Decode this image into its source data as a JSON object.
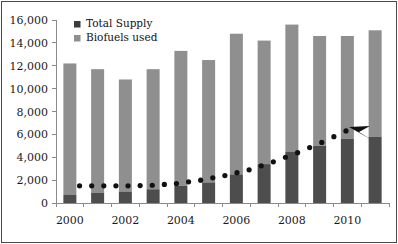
{
  "chart_data": {
    "type": "bar",
    "title": "",
    "subtitle": "",
    "xlabel": "",
    "ylabel": "",
    "stacked": true,
    "grid": false,
    "legend_position": "top-left",
    "ylim": [
      0,
      16000
    ],
    "ytick_labels": [
      "16,000",
      "14,000",
      "12,000",
      "10,000",
      "8,000",
      "6,000",
      "4,000",
      "2,000",
      "0"
    ],
    "ytick_values": [
      16000,
      14000,
      12000,
      10000,
      8000,
      6000,
      4000,
      2000,
      0
    ],
    "categories": [
      "2000",
      "2001",
      "2002",
      "2003",
      "2004",
      "2005",
      "2006",
      "2007",
      "2008",
      "2009",
      "2010",
      "2011"
    ],
    "xtick_labels_shown": [
      "2000",
      "2002",
      "2004",
      "2006",
      "2008",
      "2010"
    ],
    "series": [
      {
        "name": "Total Supply",
        "color": "#4d4d4d",
        "values": [
          700,
          900,
          1000,
          1200,
          1500,
          1800,
          2500,
          3400,
          4500,
          5000,
          5600,
          5800
        ]
      },
      {
        "name": "Biofuels used",
        "color": "#8f8f8f",
        "values": [
          11500,
          10800,
          9800,
          10500,
          11800,
          10700,
          12300,
          10800,
          11100,
          9600,
          9000,
          9300
        ]
      }
    ],
    "totals": [
      12200,
      11700,
      10800,
      11700,
      13300,
      12500,
      14800,
      14200,
      15600,
      14600,
      14600,
      15100
    ],
    "annotations": [
      {
        "type": "dotted-trend-arrow",
        "label": "",
        "color": "#111111",
        "start_value": 1500,
        "end_value": 6500,
        "points": [
          1500,
          1500,
          1500,
          1550,
          1700,
          2000,
          2400,
          2900,
          3600,
          4400,
          5300,
          6300
        ]
      }
    ]
  },
  "legend": {
    "items": [
      {
        "label": "Total Supply",
        "swatch": "#3b3b3b"
      },
      {
        "label": "Biofuels used",
        "swatch": "#8f8f8f"
      }
    ]
  },
  "colors": {
    "total_supply": "#4d4d4d",
    "biofuels_used": "#8f8f8f",
    "axis": "#8a8a8a",
    "frame": "#4a4a4a",
    "text": "#1a1a1a",
    "trend": "#111111",
    "background": "#ffffff"
  }
}
